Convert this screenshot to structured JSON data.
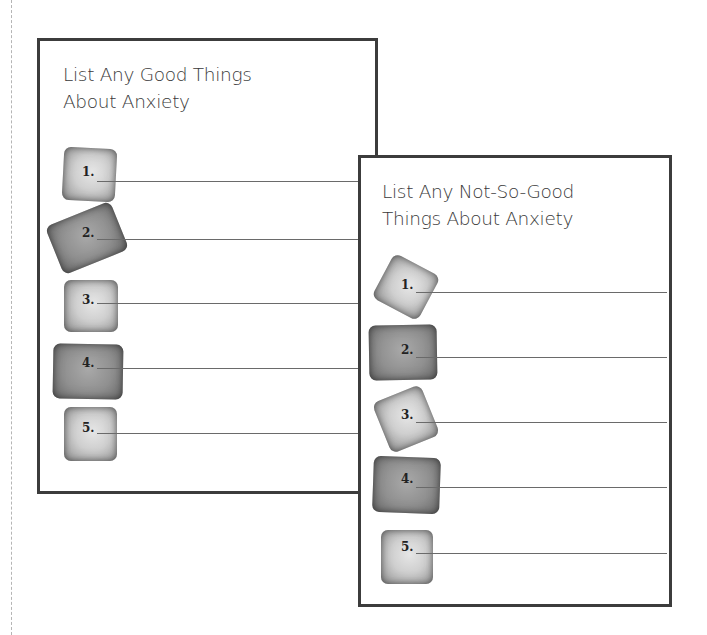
{
  "worksheet": {
    "good_card": {
      "title_line1": "List Any Good Things",
      "title_line2": "About Anxiety",
      "items": [
        {
          "label": "1.",
          "stone": "light"
        },
        {
          "label": "2.",
          "stone": "dark"
        },
        {
          "label": "3.",
          "stone": "light"
        },
        {
          "label": "4.",
          "stone": "dark"
        },
        {
          "label": "5.",
          "stone": "light"
        }
      ]
    },
    "bad_card": {
      "title_line1": "List Any Not-So-Good",
      "title_line2": "Things About Anxiety",
      "items": [
        {
          "label": "1.",
          "stone": "light"
        },
        {
          "label": "2.",
          "stone": "dark"
        },
        {
          "label": "3.",
          "stone": "light"
        },
        {
          "label": "4.",
          "stone": "dark"
        },
        {
          "label": "5.",
          "stone": "light"
        }
      ]
    }
  },
  "colors": {
    "border": "#3c3c3c",
    "title_text": "#3a3a3a",
    "line": "#6a6a6a",
    "stone_light": "#d0d0d0",
    "stone_dark": "#8f8f8f"
  }
}
